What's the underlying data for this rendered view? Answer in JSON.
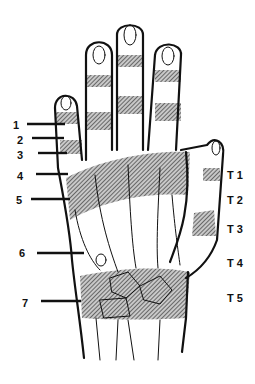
{
  "diagram": {
    "finger_zone_labels": [
      "1",
      "2",
      "3",
      "4",
      "5",
      "6",
      "7"
    ],
    "thumb_zone_labels": [
      "T 1",
      "T 2",
      "T 3",
      "T 4",
      "T 5"
    ],
    "colors": {
      "line": "#111111",
      "hatch": "#555555",
      "background": "#ffffff"
    }
  }
}
